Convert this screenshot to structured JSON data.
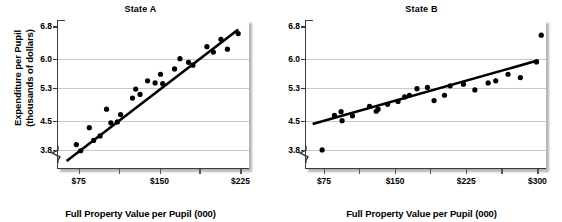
{
  "figure": {
    "ylabel_line1": "Expenditure per Pupil",
    "ylabel_line2": "(thousands of dollars)",
    "xlabel": "Full Property Value per Pupil (000)",
    "colors": {
      "dot": "#000000",
      "trendline": "#000000",
      "gridline": "#c9c9c9",
      "axis": "#3a3a3a"
    }
  },
  "chart_data": [
    {
      "type": "scatter",
      "title": "State A",
      "xlabel": "Full Property Value per Pupil (000)",
      "ylabel": "Expenditure per Pupil (thousands of dollars)",
      "xlim": [
        55,
        232
      ],
      "ylim": [
        3.35,
        6.95
      ],
      "yticks": [
        3.8,
        4.5,
        5.3,
        6.0,
        6.8
      ],
      "ytick_labels": [
        "3.8",
        "4.5",
        "5.3",
        "6.0",
        "6.8"
      ],
      "xticks": [
        75,
        112,
        150,
        187,
        225
      ],
      "xtick_labels": [
        "$75",
        "",
        "$150",
        "",
        "$225"
      ],
      "grid": true,
      "y_axis_break": true,
      "legend": "none",
      "trendline": {
        "x": [
          63,
          222
        ],
        "y": [
          3.52,
          6.72
        ]
      },
      "points": [
        {
          "x": 72,
          "y": 3.92
        },
        {
          "x": 76,
          "y": 3.77
        },
        {
          "x": 84,
          "y": 4.33
        },
        {
          "x": 88,
          "y": 4.02
        },
        {
          "x": 94,
          "y": 4.13
        },
        {
          "x": 100,
          "y": 4.78
        },
        {
          "x": 104,
          "y": 4.45
        },
        {
          "x": 110,
          "y": 4.47
        },
        {
          "x": 113,
          "y": 4.65
        },
        {
          "x": 124,
          "y": 5.05
        },
        {
          "x": 127,
          "y": 5.27
        },
        {
          "x": 131,
          "y": 5.14
        },
        {
          "x": 138,
          "y": 5.47
        },
        {
          "x": 145,
          "y": 5.42
        },
        {
          "x": 150,
          "y": 5.63
        },
        {
          "x": 152,
          "y": 5.4
        },
        {
          "x": 163,
          "y": 5.76
        },
        {
          "x": 168,
          "y": 6.01
        },
        {
          "x": 176,
          "y": 5.92
        },
        {
          "x": 180,
          "y": 5.85
        },
        {
          "x": 193,
          "y": 6.3
        },
        {
          "x": 199,
          "y": 6.17
        },
        {
          "x": 206,
          "y": 6.48
        },
        {
          "x": 212,
          "y": 6.24
        },
        {
          "x": 222,
          "y": 6.62
        }
      ]
    },
    {
      "type": "scatter",
      "title": "State B",
      "xlabel": "Full Property Value per Pupil (000)",
      "ylabel": "Expenditure per Pupil (thousands of dollars)",
      "xlim": [
        55,
        308
      ],
      "ylim": [
        3.35,
        6.95
      ],
      "yticks": [
        3.8,
        4.5,
        5.3,
        6.0,
        6.8
      ],
      "ytick_labels": [
        "3.8",
        "4.5",
        "5.3",
        "6.0",
        "6.8"
      ],
      "xticks": [
        75,
        112,
        150,
        187,
        225,
        262,
        300
      ],
      "xtick_labels": [
        "$75",
        "",
        "$150",
        "",
        "$225",
        "",
        "$300"
      ],
      "grid": true,
      "y_axis_break": true,
      "legend": "none",
      "trendline": {
        "x": [
          62,
          300
        ],
        "y": [
          4.42,
          5.97
        ]
      },
      "points": [
        {
          "x": 72,
          "y": 3.79
        },
        {
          "x": 85,
          "y": 4.63
        },
        {
          "x": 92,
          "y": 4.72
        },
        {
          "x": 93,
          "y": 4.5
        },
        {
          "x": 104,
          "y": 4.62
        },
        {
          "x": 122,
          "y": 4.85
        },
        {
          "x": 129,
          "y": 4.73
        },
        {
          "x": 131,
          "y": 4.78
        },
        {
          "x": 141,
          "y": 4.9
        },
        {
          "x": 152,
          "y": 4.97
        },
        {
          "x": 159,
          "y": 5.08
        },
        {
          "x": 164,
          "y": 5.12
        },
        {
          "x": 172,
          "y": 5.28
        },
        {
          "x": 183,
          "y": 5.31
        },
        {
          "x": 190,
          "y": 4.99
        },
        {
          "x": 201,
          "y": 5.12
        },
        {
          "x": 207,
          "y": 5.35
        },
        {
          "x": 221,
          "y": 5.39
        },
        {
          "x": 233,
          "y": 5.25
        },
        {
          "x": 247,
          "y": 5.42
        },
        {
          "x": 255,
          "y": 5.47
        },
        {
          "x": 268,
          "y": 5.63
        },
        {
          "x": 281,
          "y": 5.55
        },
        {
          "x": 298,
          "y": 5.93
        },
        {
          "x": 303,
          "y": 6.58
        }
      ]
    }
  ]
}
